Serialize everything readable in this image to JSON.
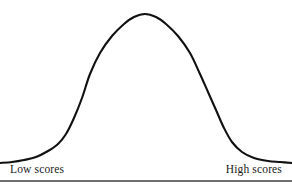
{
  "figure": {
    "background_color": "#ffffff",
    "curve_color": "#111111",
    "rule_color": "#6f6f6f",
    "left_label": "Low scores",
    "right_label": "High scores"
  },
  "chart_data": {
    "type": "line",
    "title": "",
    "subtitle": "",
    "xlabel": "",
    "ylabel": "",
    "grid": false,
    "legend": false,
    "annotations": [
      "Low scores",
      "High scores"
    ],
    "axis_tick_labels": {
      "x": [
        "Low scores",
        "High scores"
      ],
      "y": []
    },
    "xlim": [
      0,
      292
    ],
    "ylim": [
      0,
      187
    ],
    "series": [
      {
        "name": "normal-distribution-curve",
        "x": [
          0,
          12,
          24,
          36,
          48,
          58,
          66,
          74,
          82,
          90,
          100,
          112,
          124,
          134,
          145,
          156,
          166,
          178,
          190,
          200,
          208,
          216,
          224,
          232,
          242,
          254,
          268,
          280,
          292
        ],
        "y": [
          163,
          162,
          160,
          157,
          151,
          144,
          134,
          118,
          98,
          74,
          53,
          36,
          24,
          17,
          14,
          17,
          24,
          36,
          53,
          74,
          92,
          110,
          128,
          142,
          152,
          158,
          161,
          162,
          163
        ]
      }
    ]
  }
}
